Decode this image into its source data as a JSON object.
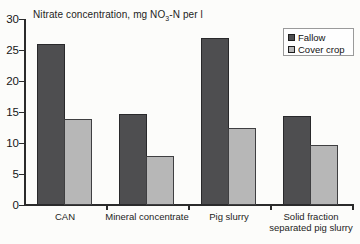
{
  "chart_data": {
    "type": "bar",
    "title": "Nitrate concentration, mg NO3-N per l",
    "title_parts": {
      "prefix": "Nitrate concentration, mg NO",
      "subscript": "3",
      "suffix": "-N per l"
    },
    "categories": [
      "CAN",
      "Mineral concentrate",
      "Pig slurry",
      "Solid fraction separated pig slurry"
    ],
    "series": [
      {
        "name": "Fallow",
        "values": [
          26.0,
          14.7,
          27.0,
          14.4
        ],
        "color": "#4e4e50",
        "border_color": "#29292b"
      },
      {
        "name": "Cover crop",
        "values": [
          13.9,
          7.9,
          12.4,
          9.6
        ],
        "color": "#b7b7b7",
        "border_color": "#3f3f41"
      }
    ],
    "xlabel": "",
    "ylabel": "",
    "ylim": [
      0,
      30
    ],
    "yticks": [
      0,
      5,
      10,
      15,
      20,
      25,
      30
    ],
    "ytick_step": 5,
    "grid": false,
    "legend_position": "top-right",
    "axis_color": "#2b2b2b",
    "background": "#fcfcfa"
  }
}
